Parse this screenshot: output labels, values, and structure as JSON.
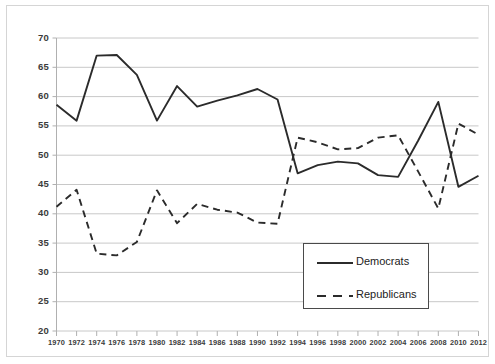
{
  "chart_data": {
    "type": "line",
    "title": "",
    "subtitle": "",
    "xlabel": "",
    "ylabel": "",
    "xlim": [
      1970,
      2012
    ],
    "ylim": [
      20,
      70
    ],
    "yticks": [
      20,
      25,
      30,
      35,
      40,
      45,
      50,
      55,
      60,
      65,
      70
    ],
    "grid": "horizontal",
    "legend_position": "bottom-right",
    "x": [
      1970,
      1972,
      1974,
      1976,
      1978,
      1980,
      1982,
      1984,
      1986,
      1988,
      1990,
      1992,
      1994,
      1996,
      1998,
      2000,
      2002,
      2004,
      2006,
      2008,
      2010,
      2012
    ],
    "xtick_labels": [
      "1970",
      "1972",
      "1974",
      "1976",
      "1978",
      "1980",
      "1982",
      "1984",
      "1986",
      "1988",
      "1990",
      "1992",
      "1994",
      "1996",
      "1998",
      "2000",
      "2002",
      "2004",
      "2006",
      "2008",
      "2010",
      "2012"
    ],
    "ytick_labels": [
      "20",
      "25",
      "30",
      "35",
      "40",
      "45",
      "50",
      "55",
      "60",
      "65",
      "70"
    ],
    "series": [
      {
        "name": "Democrats",
        "style": "solid",
        "color": "#2b2b2b",
        "values": [
          58.6,
          55.9,
          67.0,
          67.1,
          63.7,
          55.9,
          61.8,
          58.3,
          59.3,
          60.2,
          61.3,
          59.5,
          46.9,
          48.3,
          48.9,
          48.6,
          46.6,
          46.3,
          52.5,
          59.1,
          44.6,
          46.5
        ]
      },
      {
        "name": "Republicans",
        "style": "dashed",
        "color": "#2b2b2b",
        "values": [
          41.2,
          44.1,
          33.2,
          32.9,
          35.2,
          44.0,
          38.4,
          41.7,
          40.7,
          40.2,
          38.5,
          38.3,
          53.0,
          52.2,
          51.0,
          51.2,
          53.0,
          53.4,
          47.2,
          40.9,
          55.4,
          53.5
        ]
      }
    ]
  },
  "legend": {
    "items": [
      {
        "label": "Democrats",
        "style": "solid"
      },
      {
        "label": "Republicans",
        "style": "dashed"
      }
    ]
  },
  "colors": {
    "gridline": "#c8c8c8",
    "axis": "#b0b0b0",
    "series": "#2b2b2b",
    "tick_text": "#3b3b3b",
    "frame": "#d5d5d5",
    "legend_border": "#4a4a4a",
    "background": "#ffffff"
  }
}
